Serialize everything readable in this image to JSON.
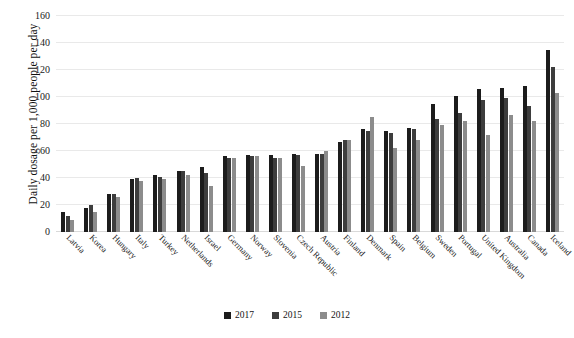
{
  "chart_data": {
    "type": "bar",
    "title": "",
    "subtitle": "",
    "xlabel": "",
    "ylabel": "Daily dosage per 1,000 people per day",
    "ylim": [
      0,
      160
    ],
    "yticks": [
      0,
      20,
      40,
      60,
      80,
      100,
      120,
      140,
      160
    ],
    "grid": true,
    "legend_position": "bottom-center",
    "categories": [
      "Latvia",
      "Korea",
      "Hungary",
      "Italy",
      "Turkey",
      "Netherlands",
      "Israel",
      "Germany",
      "Norway",
      "Slovenia",
      "Czech Republic",
      "Austria",
      "Finland",
      "Denmark",
      "Spain",
      "Belgium",
      "Sweden",
      "Portugal",
      "United Kingdom",
      "Australia",
      "Canada",
      "Iceland"
    ],
    "series": [
      {
        "name": "2017",
        "color": "#1c1c1c",
        "values": [
          15,
          18,
          28,
          39,
          42,
          45,
          48,
          56,
          57,
          57,
          58,
          58,
          67,
          76,
          75,
          77,
          95,
          101,
          106,
          107,
          108,
          135
        ]
      },
      {
        "name": "2015",
        "color": "#3d3d3d",
        "values": [
          12,
          20,
          28,
          40,
          41,
          45,
          44,
          55,
          56,
          55,
          57,
          58,
          68,
          75,
          73,
          76,
          84,
          88,
          98,
          99,
          93,
          122
        ]
      },
      {
        "name": "2012",
        "color": "#8c8c8c",
        "values": [
          9,
          15,
          26,
          38,
          39,
          42,
          34,
          55,
          56,
          55,
          49,
          60,
          68,
          85,
          62,
          68,
          79,
          82,
          72,
          87,
          82,
          103
        ]
      }
    ]
  },
  "legend": {
    "items": [
      {
        "label": "2017",
        "color": "#1c1c1c"
      },
      {
        "label": "2015",
        "color": "#3d3d3d"
      },
      {
        "label": "2012",
        "color": "#8c8c8c"
      }
    ]
  },
  "axis": {
    "y_title": "Daily dosage per 1,000 people per day",
    "y_tick_labels": [
      "0",
      "20",
      "40",
      "60",
      "80",
      "100",
      "120",
      "140",
      "160"
    ]
  }
}
